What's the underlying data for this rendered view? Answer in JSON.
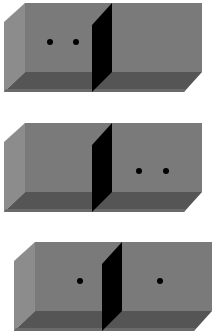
{
  "diagram": {
    "colors": {
      "back_wall": "#7a7a7a",
      "side_wall": "#8c8c8c",
      "floor": "#555555",
      "floor_edge": "#6a6a6a",
      "partition": "#000000",
      "particle": "#000000",
      "background": "#ffffff"
    },
    "panels": [
      {
        "name": "panel-1",
        "particles_left": 2,
        "particles_right": 0
      },
      {
        "name": "panel-2",
        "particles_left": 0,
        "particles_right": 2
      },
      {
        "name": "panel-3",
        "particles_left": 1,
        "particles_right": 1
      }
    ]
  }
}
